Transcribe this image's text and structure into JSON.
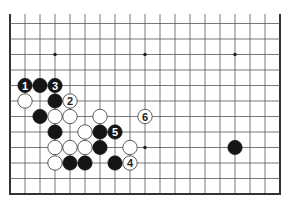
{
  "board": {
    "title": "Go problem diagram",
    "columns": 19,
    "col_x0": 10,
    "col_step": 15,
    "row_y": [
      23.5,
      39,
      54.5,
      70,
      85.5,
      101,
      116.5,
      132,
      147.5,
      163,
      178.5
    ],
    "top_y": 14,
    "bottom_edge_y": 194,
    "left_edge_x": 10,
    "right_edge_x": 280,
    "line_color": "#555555",
    "edge_color": "#333333",
    "star_points": [
      {
        "c": 3,
        "r": 2
      },
      {
        "c": 9,
        "r": 2
      },
      {
        "c": 15,
        "r": 2
      },
      {
        "c": 9,
        "r": 8
      }
    ],
    "stones": [
      {
        "color": "black",
        "c": 1,
        "r": 4,
        "label": "1"
      },
      {
        "color": "black",
        "c": 2,
        "r": 4,
        "label": ""
      },
      {
        "color": "black",
        "c": 3,
        "r": 4,
        "label": "3"
      },
      {
        "color": "white",
        "c": 1,
        "r": 5,
        "label": ""
      },
      {
        "color": "black",
        "c": 3,
        "r": 5,
        "label": ""
      },
      {
        "color": "white",
        "c": 4,
        "r": 5,
        "label": "2"
      },
      {
        "color": "black",
        "c": 2,
        "r": 6,
        "label": ""
      },
      {
        "color": "white",
        "c": 3,
        "r": 6,
        "label": ""
      },
      {
        "color": "white",
        "c": 4,
        "r": 6,
        "label": ""
      },
      {
        "color": "white",
        "c": 6,
        "r": 6,
        "label": ""
      },
      {
        "color": "white",
        "c": 9,
        "r": 6,
        "label": "6"
      },
      {
        "color": "black",
        "c": 3,
        "r": 7,
        "label": ""
      },
      {
        "color": "white",
        "c": 5,
        "r": 7,
        "label": ""
      },
      {
        "color": "black",
        "c": 6,
        "r": 7,
        "label": ""
      },
      {
        "color": "black",
        "c": 7,
        "r": 7,
        "label": "5"
      },
      {
        "color": "white",
        "c": 3,
        "r": 8,
        "label": ""
      },
      {
        "color": "white",
        "c": 4,
        "r": 8,
        "label": ""
      },
      {
        "color": "white",
        "c": 5,
        "r": 8,
        "label": ""
      },
      {
        "color": "black",
        "c": 6,
        "r": 8,
        "label": ""
      },
      {
        "color": "white",
        "c": 8,
        "r": 8,
        "label": ""
      },
      {
        "color": "black",
        "c": 15,
        "r": 8,
        "label": ""
      },
      {
        "color": "white",
        "c": 3,
        "r": 9,
        "label": ""
      },
      {
        "color": "black",
        "c": 4,
        "r": 9,
        "label": ""
      },
      {
        "color": "black",
        "c": 5,
        "r": 9,
        "label": ""
      },
      {
        "color": "black",
        "c": 7,
        "r": 9,
        "label": ""
      },
      {
        "color": "white",
        "c": 8,
        "r": 9,
        "label": "4"
      }
    ]
  }
}
